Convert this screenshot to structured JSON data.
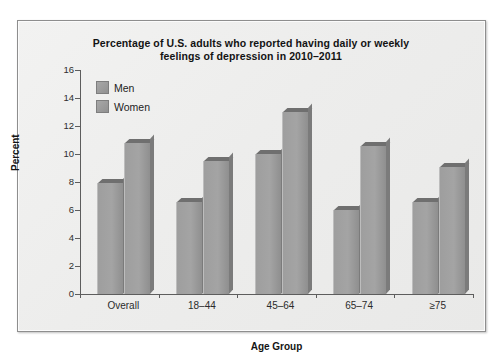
{
  "chart_data": {
    "type": "bar",
    "title": "Percentage of U.S. adults who reported having daily or weekly feelings of depression in 2010–2011",
    "title_line1": "Percentage of U.S. adults who reported having daily or weekly",
    "title_line2": "feelings of depression in 2010–2011",
    "xlabel": "Age Group",
    "ylabel": "Percent",
    "categories": [
      "Overall",
      "18–44",
      "45–64",
      "65–74",
      "≥75"
    ],
    "series": [
      {
        "name": "Men",
        "values": [
          7.9,
          6.6,
          10.0,
          6.0,
          6.6
        ]
      },
      {
        "name": "Women",
        "values": [
          10.8,
          9.5,
          13.0,
          10.6,
          9.1
        ]
      }
    ],
    "ylim": [
      0,
      16
    ],
    "yticks": [
      0,
      2,
      4,
      6,
      8,
      10,
      12,
      14,
      16
    ],
    "ytick_labels": [
      "0",
      "2",
      "4",
      "6",
      "8",
      "10",
      "12",
      "14",
      "16"
    ],
    "grid": false,
    "legend_position": "upper-left-inside",
    "colors": {
      "men_bar": "#9e9e9e",
      "women_bar": "#9e9e9e",
      "bar_top": "#6f6f6f",
      "bar_side": "#7b7b7b",
      "axis": "#5d5d5d",
      "panel_background": "#eeeeed",
      "panel_border": "#8e8e8e",
      "text": "#141414"
    }
  }
}
